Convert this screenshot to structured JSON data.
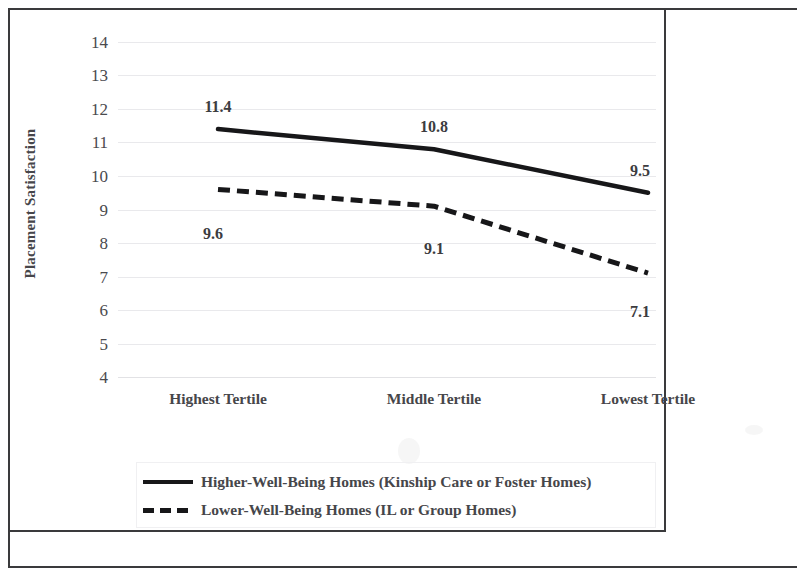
{
  "chart_data": {
    "type": "line",
    "title": "",
    "xlabel": "",
    "ylabel": "Placement Satisfaction",
    "ylim": [
      4,
      14
    ],
    "yticks": [
      14,
      13,
      12,
      11,
      10,
      9,
      8,
      7,
      6,
      5,
      4
    ],
    "categories": [
      "Highest Tertile",
      "Middle Tertile",
      "Lowest Tertile"
    ],
    "grid": true,
    "legend_position": "bottom",
    "series": [
      {
        "name": "Higher-Well-Being Homes (Kinship Care or Foster Homes)",
        "style": "solid",
        "color": "#171719",
        "values": [
          11.4,
          10.8,
          9.5
        ],
        "labels": [
          "11.4",
          "10.8",
          "9.5"
        ],
        "label_position": "above"
      },
      {
        "name": "Lower-Well-Being Homes (IL or Group Homes)",
        "style": "dashed",
        "color": "#171719",
        "values": [
          9.6,
          9.1,
          7.1
        ],
        "labels": [
          "9.6",
          "9.1",
          "7.1"
        ],
        "label_position": "below"
      }
    ]
  },
  "axis": {
    "y_title": "Placement Satisfaction",
    "y_tick_labels": [
      "14",
      "13",
      "12",
      "11",
      "10",
      "9",
      "8",
      "7",
      "6",
      "5",
      "4"
    ],
    "x_tick_labels": [
      "Highest Tertile",
      "Middle Tertile",
      "Lowest Tertile"
    ]
  },
  "data_labels": {
    "solid": [
      "11.4",
      "10.8",
      "9.5"
    ],
    "dashed": [
      "9.6",
      "9.1",
      "7.1"
    ]
  },
  "legend": {
    "items": [
      {
        "label": "Higher-Well-Being Homes (Kinship Care or Foster Homes)",
        "style": "solid"
      },
      {
        "label": "Lower-Well-Being Homes (IL or Group Homes)",
        "style": "dashed"
      }
    ]
  },
  "colors": {
    "line": "#171719",
    "text": "#46464a",
    "grid": "#e9e9ec",
    "frame": "#3a3a3c",
    "background": "#ffffff"
  }
}
